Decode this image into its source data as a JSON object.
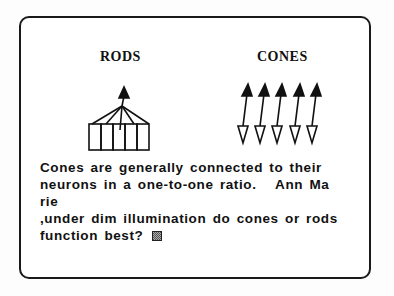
{
  "diagram": {
    "rods_label": "RODS",
    "cones_label": "CONES",
    "rods_count": 5,
    "cones_count": 5
  },
  "message": {
    "lines": [
      "Cones are generally connected to their",
      "neurons in a one-to-one ratio.   Ann Ma",
      "rie",
      ",under dim illumination do cones or rods",
      "function best?"
    ]
  },
  "input": {
    "cursor": "block-cursor"
  }
}
